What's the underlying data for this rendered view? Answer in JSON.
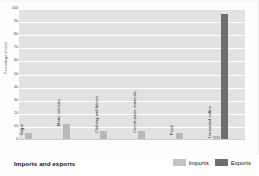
{
  "chart_data": {
    "type": "bar",
    "title": "Imports and exports",
    "xlabel": "",
    "ylabel": "Percentage of total",
    "ylim": [
      0,
      100
    ],
    "ytick_step": 10,
    "ytick_labels": [
      "100",
      "90",
      "80",
      "70",
      "60",
      "50",
      "40",
      "30",
      "20",
      "10",
      "0"
    ],
    "grid": true,
    "legend_position": "bottom-right",
    "categories": [
      "Sugar",
      "Motor vehicles",
      "Clothing and fabrics",
      "Construction materials",
      "Food",
      "Unroasted coffee"
    ],
    "series": [
      {
        "name": "Imports",
        "color": "#b9b9b9",
        "values": [
          5,
          12,
          7,
          7,
          5,
          3
        ]
      },
      {
        "name": "Exports",
        "color": "#6e6e6e",
        "values": [
          0,
          0,
          0,
          0,
          0,
          96
        ]
      }
    ],
    "bars": [
      {
        "category": "Sugar",
        "series": "Imports",
        "value": 5
      },
      {
        "category": "Motor vehicles",
        "series": "Imports",
        "value": 12
      },
      {
        "category": "Clothing and fabrics",
        "series": "Imports",
        "value": 7
      },
      {
        "category": "Construction materials",
        "series": "Imports",
        "value": 7
      },
      {
        "category": "Food",
        "series": "Imports",
        "value": 5
      },
      {
        "category": "Unroasted coffee",
        "series": "Imports",
        "value": 3
      },
      {
        "category": "Unroasted coffee",
        "series": "Exports",
        "value": 96
      }
    ]
  },
  "legend": {
    "items": [
      {
        "label": "Imports",
        "color": "#c3c3c3"
      },
      {
        "label": "Exports",
        "color": "#6e6e6e"
      }
    ]
  },
  "colors": {
    "plot_background": "#e2e2e2",
    "gridline": "#ffffff",
    "imports": "#b9b9b9",
    "exports": "#6e6e6e",
    "text": "#111111"
  }
}
